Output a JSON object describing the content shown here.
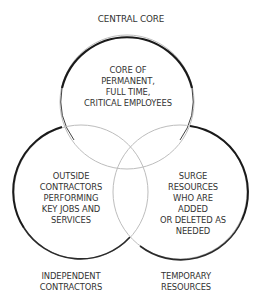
{
  "diagram": {
    "type": "venn",
    "title": "Central Core",
    "circles": [
      {
        "id": "central-core",
        "label": "CENTRAL CORE",
        "description": "CORE OF\nPERMANENT,\nFULL TIME,\nCRITICAL EMPLOYEES",
        "cx": 127,
        "cy": 102,
        "r": 67
      },
      {
        "id": "independent-contractors",
        "label": "INDEPENDENT\nCONTRACTORS",
        "description": "OUTSIDE\nCONTRACTORS\nPERFORMING\nKEY JOBS AND\nSERVICES",
        "cx": 81,
        "cy": 192,
        "r": 67
      },
      {
        "id": "temporary-resources",
        "label": "TEMPORARY\nRESOURCES",
        "description": "SURGE\nRESOURCES\nWHO ARE ADDED\nOR DELETED AS\nNEEDED",
        "cx": 180,
        "cy": 192,
        "r": 67
      }
    ],
    "colors": {
      "stroke_dark": "#1a1a1a",
      "stroke_light": "#9a9a9a",
      "text": "#333333",
      "background": "#ffffff"
    }
  }
}
